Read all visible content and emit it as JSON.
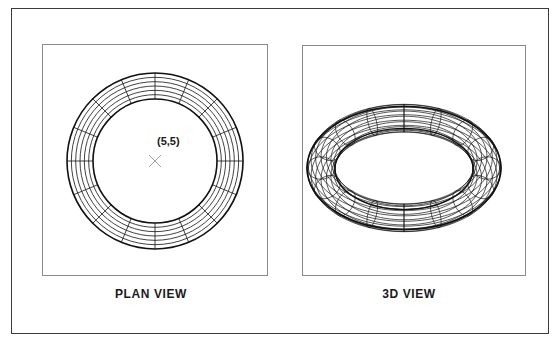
{
  "figure": {
    "plan_view": {
      "caption": "PLAN VIEW",
      "center_label": "(5,5)",
      "center_px": [
        155,
        161
      ],
      "outer_radius_px": 88,
      "inner_radius_px": 62,
      "concentric_circles": 7,
      "radial_spokes": 16,
      "marker": "x-mark"
    },
    "view_3d": {
      "caption": "3D VIEW",
      "center_px": [
        404,
        168
      ],
      "major_radius_px": 83,
      "minor_radius_px": 14,
      "tilt_cos": 0.6,
      "parallels": 16,
      "meridians": 16
    },
    "colors": {
      "line": "#111111",
      "frame": "#3a3a3a",
      "panel_border": "#8a8a8a",
      "marker": "#9a9a9a"
    }
  }
}
